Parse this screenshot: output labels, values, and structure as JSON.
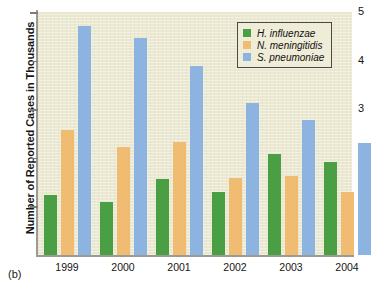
{
  "caption": "(b)",
  "legend": {
    "position": "top-right",
    "entries": [
      {
        "label": "H. influenzae",
        "color": "#4a9e44"
      },
      {
        "label": "N. meningitidis",
        "color": "#f0bc72"
      },
      {
        "label": "S. pneumoniae",
        "color": "#8db4e0"
      }
    ]
  },
  "axis": {
    "y_title": "Number of Reported Cases in Thousands",
    "y_ticks": [
      "5",
      "4",
      "3",
      "2",
      "1"
    ],
    "x_ticks": [
      "1999",
      "2000",
      "2001",
      "2002",
      "2003",
      "2004"
    ]
  },
  "colors": {
    "series_green": "#4a9e44",
    "series_orange": "#f0bc72",
    "series_blue": "#8db4e0",
    "plot_background": "#ece9d2",
    "axis_line": "#9b9b92",
    "page_background": "#ffffff"
  },
  "chart_data": {
    "type": "bar",
    "title": "",
    "xlabel": "",
    "ylabel": "Number of Reported Cases in Thousands",
    "categories": [
      "1999",
      "2000",
      "2001",
      "2002",
      "2003",
      "2004"
    ],
    "series": [
      {
        "name": "H. influenzae",
        "color": "#4a9e44",
        "values": [
          1.24,
          1.09,
          1.57,
          1.3,
          2.08,
          1.91
        ]
      },
      {
        "name": "N. meningitidis",
        "color": "#f0bc72",
        "values": [
          2.58,
          2.23,
          2.33,
          1.59,
          1.62,
          1.3
        ]
      },
      {
        "name": "S. pneumoniae",
        "color": "#8db4e0",
        "values": [
          4.72,
          4.46,
          3.88,
          3.13,
          2.78,
          2.31
        ]
      }
    ],
    "ylim": [
      0,
      5
    ],
    "yticks": [
      1,
      2,
      3,
      4,
      5
    ],
    "grid": false,
    "legend_position": "upper right"
  }
}
